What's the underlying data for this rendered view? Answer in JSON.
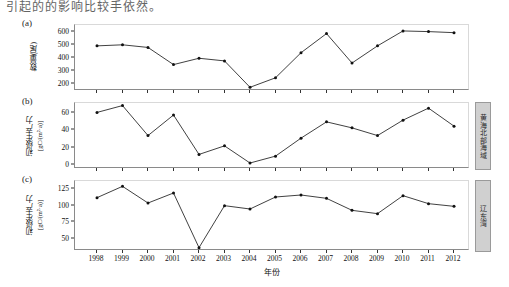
{
  "page": {
    "top_text": "引起的的影响比较手依然。"
  },
  "xaxis": {
    "title": "年份",
    "categories": [
      "1998",
      "1999",
      "2000",
      "2001",
      "2002",
      "2003",
      "2004",
      "2005",
      "2006",
      "2007",
      "2008",
      "2009",
      "2010",
      "2011",
      "2012"
    ]
  },
  "side_labels": {
    "panel_b": "黄海北部海域",
    "panel_c": "辽东湾"
  },
  "panels": [
    {
      "tag": "(a)",
      "ylabel": "数量(尾)",
      "ylabel_unit": "",
      "yticks": [
        200,
        300,
        400,
        500,
        600
      ],
      "ylim": [
        150,
        650
      ]
    },
    {
      "tag": "(b)",
      "ylabel": "初级生产力",
      "ylabel_unit": "[gC/(m²·a)]",
      "yticks": [
        0,
        20,
        40,
        60
      ],
      "ylim": [
        -5,
        72
      ]
    },
    {
      "tag": "(c)",
      "ylabel": "初级生产力",
      "ylabel_unit": "[gC/(m²·a)]",
      "yticks": [
        50,
        75,
        100,
        125
      ],
      "ylim": [
        32,
        137
      ]
    }
  ],
  "chart_data": [
    {
      "type": "line",
      "title": "(a)",
      "xlabel": "年份",
      "ylabel": "数量(尾)",
      "categories": [
        "1998",
        "1999",
        "2000",
        "2001",
        "2002",
        "2003",
        "2004",
        "2005",
        "2006",
        "2007",
        "2008",
        "2009",
        "2010",
        "2011",
        "2012"
      ],
      "values": [
        492,
        500,
        480,
        350,
        398,
        378,
        178,
        250,
        440,
        585,
        362,
        492,
        605,
        600,
        592
      ],
      "ylim": [
        150,
        650
      ],
      "grid": false,
      "legend": "none"
    },
    {
      "type": "line",
      "title": "(b)",
      "xlabel": "年份",
      "ylabel": "初级生产力 [gC/(m²·a)]",
      "categories": [
        "1998",
        "1999",
        "2000",
        "2001",
        "2002",
        "2003",
        "2004",
        "2005",
        "2006",
        "2007",
        "2008",
        "2009",
        "2010",
        "2011",
        "2012"
      ],
      "values": [
        61,
        69,
        34,
        58,
        12,
        22,
        2,
        10,
        31,
        50,
        43,
        34,
        52,
        66,
        45,
        61
      ],
      "ylim": [
        -5,
        72
      ],
      "grid": false,
      "legend": "none"
    },
    {
      "type": "line",
      "title": "(c)",
      "xlabel": "年份",
      "ylabel": "初级生产力 [gC/(m²·a)]",
      "categories": [
        "1998",
        "1999",
        "2000",
        "2001",
        "2002",
        "2003",
        "2004",
        "2005",
        "2006",
        "2007",
        "2008",
        "2009",
        "2010",
        "2011",
        "2012"
      ],
      "values": [
        112,
        129,
        104,
        119,
        37,
        100,
        95,
        113,
        116,
        111,
        93,
        88,
        115,
        103,
        99,
        92
      ],
      "ylim": [
        32,
        137
      ],
      "grid": false,
      "legend": "none"
    }
  ]
}
